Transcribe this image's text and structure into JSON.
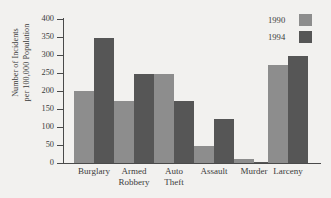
{
  "chart_data": {
    "type": "bar",
    "title": "",
    "xlabel": "",
    "ylabel": "Number of Incidents per 100,000 Population",
    "ylabel_lines": [
      "Number of Incidents",
      "per 100,000 Population"
    ],
    "categories": [
      "Burglary",
      "Armed Robbery",
      "Auto Theft",
      "Assault",
      "Murder",
      "Larceny"
    ],
    "category_lines": [
      [
        "Burglary"
      ],
      [
        "Armed",
        "Robbery"
      ],
      [
        "Auto",
        "Theft"
      ],
      [
        "Assault"
      ],
      [
        "Murder"
      ],
      [
        "Larceny"
      ]
    ],
    "series": [
      {
        "name": "1990",
        "color": "#8d8d8d",
        "values": [
          200,
          172,
          248,
          48,
          10,
          271
        ]
      },
      {
        "name": "1994",
        "color": "#565656",
        "values": [
          348,
          248,
          171,
          122,
          4,
          297
        ]
      }
    ],
    "ylim": [
      0,
      400
    ],
    "yticks": [
      0,
      50,
      100,
      150,
      200,
      250,
      300,
      350,
      400
    ],
    "ytick_labels": [
      "0",
      "50",
      "100",
      "150",
      "200",
      "250",
      "300",
      "350",
      "400"
    ],
    "grid": false,
    "legend_position": "top-right"
  },
  "legend": {
    "entries": [
      {
        "label": "1990",
        "color": "#8d8d8d"
      },
      {
        "label": "1994",
        "color": "#565656"
      }
    ]
  },
  "colors": {
    "background": "#f2f1ef",
    "axis": "#4a4a4a",
    "text": "#3b3b3b"
  }
}
